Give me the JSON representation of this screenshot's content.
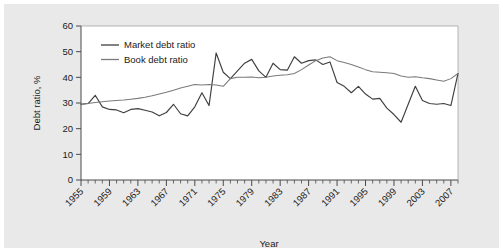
{
  "chart_data": {
    "type": "line",
    "title": "",
    "xlabel": "Year",
    "ylabel": "Debt ratio, %",
    "xlim": [
      1955,
      2008
    ],
    "ylim": [
      0,
      60
    ],
    "yticks": [
      0,
      10,
      20,
      30,
      40,
      50,
      60
    ],
    "ytick_labels": [
      "0",
      "10",
      "20",
      "30",
      "40",
      "50",
      "60"
    ],
    "xticks": [
      1955,
      1959,
      1963,
      1967,
      1971,
      1975,
      1979,
      1983,
      1987,
      1991,
      1995,
      1999,
      2003,
      2007
    ],
    "xtick_labels": [
      "1955",
      "1959",
      "1963",
      "1967",
      "1971",
      "1975",
      "1979",
      "1983",
      "1987",
      "1991",
      "1995",
      "1999",
      "2003",
      "2007"
    ],
    "minor_tick_interval": 1,
    "grid": false,
    "legend_position": "top-left",
    "x": [
      1955,
      1956,
      1957,
      1958,
      1959,
      1960,
      1961,
      1962,
      1963,
      1964,
      1965,
      1966,
      1967,
      1968,
      1969,
      1970,
      1971,
      1972,
      1973,
      1974,
      1975,
      1976,
      1977,
      1978,
      1979,
      1980,
      1981,
      1982,
      1983,
      1984,
      1985,
      1986,
      1987,
      1988,
      1989,
      1990,
      1991,
      1992,
      1993,
      1994,
      1995,
      1996,
      1997,
      1998,
      1999,
      2000,
      2001,
      2002,
      2003,
      2004,
      2005,
      2006,
      2007,
      2008
    ],
    "series": [
      {
        "name": "Market debt ratio",
        "color": "#3f3f3f",
        "values": [
          29.5,
          29.8,
          33.0,
          28.5,
          27.5,
          27.3,
          26.2,
          27.5,
          27.8,
          27.2,
          26.5,
          25.0,
          26.3,
          29.5,
          25.8,
          25.0,
          28.5,
          34.0,
          29.0,
          49.5,
          42.0,
          39.5,
          42.5,
          45.5,
          47.0,
          42.5,
          40.0,
          45.5,
          43.0,
          42.8,
          48.0,
          45.5,
          46.5,
          46.8,
          45.0,
          46.0,
          38.0,
          36.5,
          34.0,
          36.5,
          33.5,
          31.5,
          31.8,
          28.0,
          25.5,
          22.5,
          29.5,
          36.5,
          31.0,
          29.8,
          29.5,
          29.8,
          29.0,
          41.5
        ]
      },
      {
        "name": "Book debt ratio",
        "color": "#7a7a7a",
        "values": [
          29.5,
          29.8,
          30.2,
          30.5,
          30.8,
          31.0,
          31.2,
          31.5,
          31.8,
          32.2,
          32.8,
          33.5,
          34.2,
          35.0,
          35.8,
          36.5,
          37.2,
          37.0,
          37.2,
          37.0,
          36.5,
          39.5,
          40.0,
          40.0,
          40.1,
          39.8,
          40.0,
          40.5,
          40.8,
          41.0,
          41.5,
          43.0,
          44.8,
          46.5,
          47.5,
          48.0,
          46.5,
          45.8,
          45.0,
          44.0,
          43.0,
          42.2,
          42.0,
          41.8,
          41.5,
          40.5,
          40.0,
          40.2,
          39.8,
          39.5,
          39.0,
          38.5,
          39.5,
          41.5
        ]
      }
    ]
  }
}
